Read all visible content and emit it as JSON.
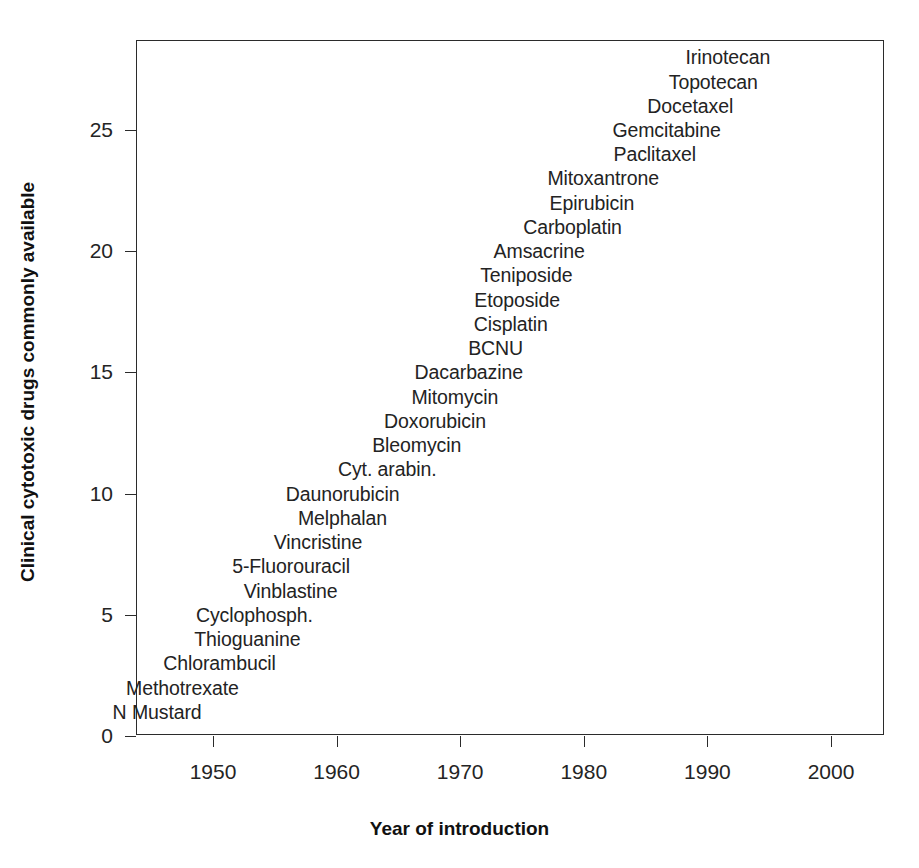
{
  "chart_data": {
    "type": "scatter",
    "title": "",
    "xlabel": "Year of introduction",
    "ylabel": "Clinical cytotoxic drugs commonly available",
    "xlim": [
      1945,
      2004
    ],
    "ylim": [
      0,
      28.6
    ],
    "xticks": [
      "1950",
      "1960",
      "1970",
      "1980",
      "1990",
      "2000"
    ],
    "xtick_values": [
      1950,
      1960,
      1970,
      1980,
      1990,
      2000
    ],
    "yticks": [
      "0",
      "5",
      "10",
      "15",
      "20",
      "25"
    ],
    "ytick_values": [
      0,
      5,
      10,
      15,
      20,
      25
    ],
    "grid": false,
    "legend": false,
    "point_marker": "none-labels-only",
    "points": [
      {
        "label": "N Mustard",
        "x": 1949,
        "y": 1
      },
      {
        "label": "Methotrexate",
        "x": 1952,
        "y": 2
      },
      {
        "label": "Chlorambucil",
        "x": 1955,
        "y": 3
      },
      {
        "label": "Thioguanine",
        "x": 1957,
        "y": 4
      },
      {
        "label": "Cyclophosph.",
        "x": 1958,
        "y": 5
      },
      {
        "label": "Vinblastine",
        "x": 1960,
        "y": 6
      },
      {
        "label": "5-Fluorouracil",
        "x": 1961,
        "y": 7
      },
      {
        "label": "Vincristine",
        "x": 1962,
        "y": 8
      },
      {
        "label": "Melphalan",
        "x": 1964,
        "y": 9
      },
      {
        "label": "Daunorubicin",
        "x": 1965,
        "y": 10
      },
      {
        "label": "Cyt. arabin.",
        "x": 1968,
        "y": 11
      },
      {
        "label": "Bleomycin",
        "x": 1970,
        "y": 12
      },
      {
        "label": "Doxorubicin",
        "x": 1972,
        "y": 13
      },
      {
        "label": "Mitomycin",
        "x": 1973,
        "y": 14
      },
      {
        "label": "Dacarbazine",
        "x": 1975,
        "y": 15
      },
      {
        "label": "BCNU",
        "x": 1975,
        "y": 16
      },
      {
        "label": "Cisplatin",
        "x": 1977,
        "y": 17
      },
      {
        "label": "Etoposide",
        "x": 1978,
        "y": 18
      },
      {
        "label": "Teniposide",
        "x": 1979,
        "y": 19
      },
      {
        "label": "Amsacrine",
        "x": 1980,
        "y": 20
      },
      {
        "label": "Carboplatin",
        "x": 1983,
        "y": 21
      },
      {
        "label": "Epirubicin",
        "x": 1984,
        "y": 22
      },
      {
        "label": "Mitoxantrone",
        "x": 1986,
        "y": 23
      },
      {
        "label": "Paclitaxel",
        "x": 1989,
        "y": 24
      },
      {
        "label": "Gemcitabine",
        "x": 1991,
        "y": 25
      },
      {
        "label": "Docetaxel",
        "x": 1992,
        "y": 26
      },
      {
        "label": "Topotecan",
        "x": 1994,
        "y": 27
      },
      {
        "label": "Irinotecan",
        "x": 1995,
        "y": 28
      }
    ]
  }
}
